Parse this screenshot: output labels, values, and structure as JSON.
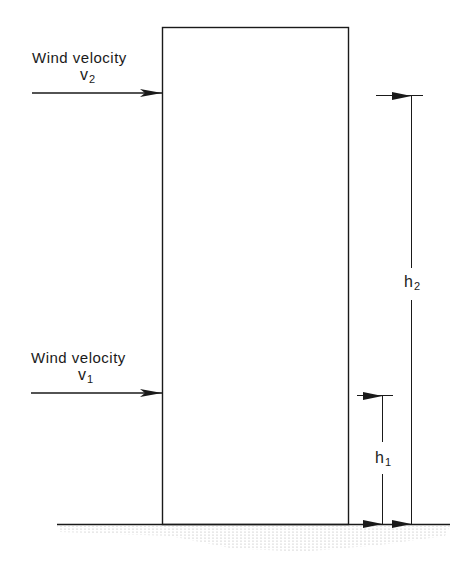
{
  "diagram": {
    "type": "building-wind-profile",
    "wind_upper": {
      "label": "Wind velocity",
      "symbol": "v",
      "subscript": "2"
    },
    "wind_lower": {
      "label": "Wind velocity",
      "symbol": "v",
      "subscript": "1"
    },
    "height_upper": {
      "symbol": "h",
      "subscript": "2"
    },
    "height_lower": {
      "symbol": "h",
      "subscript": "1"
    },
    "colors": {
      "stroke": "#1a1a1a",
      "ground_dots": "#9a9a9a",
      "background": "#ffffff"
    }
  }
}
